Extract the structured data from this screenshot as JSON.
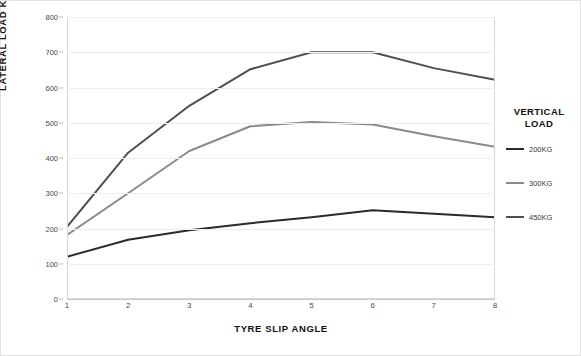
{
  "chart_data": {
    "type": "line",
    "title": "",
    "xlabel": "TYRE SLIP ANGLE",
    "ylabel": "LATERAL LOAD KG",
    "x": [
      1,
      2,
      3,
      4,
      5,
      6,
      7,
      8
    ],
    "xtick_labels": [
      "1",
      "2",
      "3",
      "4",
      "5",
      "6",
      "7",
      "8"
    ],
    "ytick_labels": [
      "0",
      "100",
      "200",
      "300",
      "400",
      "500",
      "600",
      "700",
      "800"
    ],
    "yticks": [
      0,
      100,
      200,
      300,
      400,
      500,
      600,
      700,
      800
    ],
    "xlim": [
      1,
      8
    ],
    "ylim": [
      0,
      800
    ],
    "grid": true,
    "legend_position": "right",
    "legend_title": "VERTICAL LOAD",
    "series": [
      {
        "name": "200KG",
        "color": "#2b2b2b",
        "width": 2.0,
        "values": [
          120,
          168,
          195,
          215,
          232,
          252,
          242,
          232
        ]
      },
      {
        "name": "300KG",
        "color": "#8a8a8a",
        "width": 2.0,
        "values": [
          182,
          300,
          420,
          490,
          502,
          495,
          462,
          432
        ]
      },
      {
        "name": "450KG",
        "color": "#4f4f4f",
        "width": 2.0,
        "values": [
          205,
          415,
          548,
          652,
          700,
          700,
          655,
          622
        ]
      }
    ]
  },
  "axes": {
    "y_title": "LATERAL LOAD KG",
    "x_title": "TYRE SLIP ANGLE"
  },
  "legend": {
    "title_line1": "VERTICAL",
    "title_line2": "LOAD",
    "items": [
      {
        "label": "200KG",
        "color": "#2b2b2b"
      },
      {
        "label": "300KG",
        "color": "#8a8a8a"
      },
      {
        "label": "450KG",
        "color": "#4f4f4f"
      }
    ]
  },
  "colors": {
    "grid": "#ededed",
    "frame": "#d8d8d8",
    "page_border": "#e3e3e3",
    "tick_text": "#4a4a4a",
    "title_text": "#111111"
  }
}
